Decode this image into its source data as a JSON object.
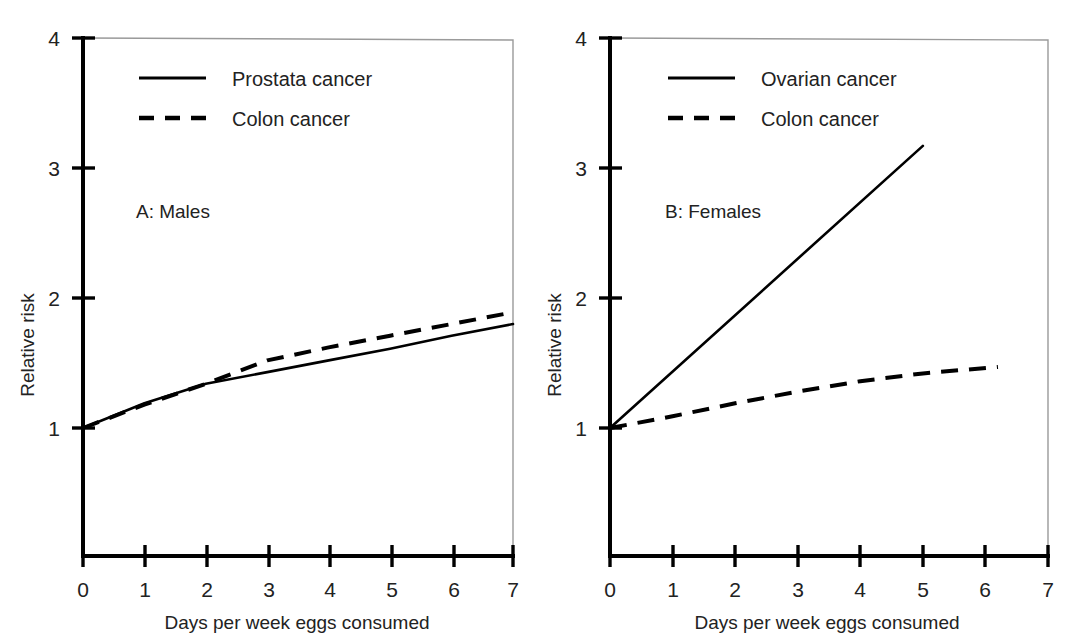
{
  "figure": {
    "panels": [
      {
        "id": "A",
        "label": "A: Males",
        "xlabel": "Days per week eggs consumed",
        "ylabel": "Relative risk",
        "xticks": [
          "0",
          "1",
          "2",
          "3",
          "4",
          "5",
          "6",
          "7"
        ],
        "yticks": [
          "1",
          "2",
          "3",
          "4"
        ],
        "legend": [
          {
            "name": "Prostata cancer",
            "style": "solid"
          },
          {
            "name": "Colon cancer",
            "style": "dashed"
          }
        ]
      },
      {
        "id": "B",
        "label": "B: Females",
        "xlabel": "Days per week eggs consumed",
        "ylabel": "Relative risk",
        "xticks": [
          "0",
          "1",
          "2",
          "3",
          "4",
          "5",
          "6",
          "7"
        ],
        "yticks": [
          "1",
          "2",
          "3",
          "4"
        ],
        "legend": [
          {
            "name": "Ovarian cancer",
            "style": "solid"
          },
          {
            "name": "Colon cancer",
            "style": "dashed"
          }
        ]
      }
    ]
  },
  "chart_data": [
    {
      "type": "line",
      "title": "A: Males",
      "xlabel": "Days per week eggs consumed",
      "ylabel": "Relative risk",
      "xlim": [
        0,
        7
      ],
      "ylim": [
        0,
        4
      ],
      "xticks": [
        0,
        1,
        2,
        3,
        4,
        5,
        6,
        7
      ],
      "yticks": [
        1,
        2,
        3,
        4
      ],
      "grid": false,
      "legend_position": "top-center",
      "series": [
        {
          "name": "Prostata cancer",
          "style": "solid",
          "x": [
            0,
            1,
            2,
            3,
            4,
            5,
            6,
            7
          ],
          "y": [
            1.0,
            1.19,
            1.34,
            1.43,
            1.52,
            1.61,
            1.71,
            1.8
          ]
        },
        {
          "name": "Colon cancer",
          "style": "dashed",
          "x": [
            0,
            1,
            2,
            3,
            4,
            5,
            6,
            7
          ],
          "y": [
            1.0,
            1.18,
            1.34,
            1.52,
            1.62,
            1.71,
            1.8,
            1.89
          ]
        }
      ]
    },
    {
      "type": "line",
      "title": "B: Females",
      "xlabel": "Days per week eggs consumed",
      "ylabel": "Relative risk",
      "xlim": [
        0,
        7
      ],
      "ylim": [
        0,
        4
      ],
      "xticks": [
        0,
        1,
        2,
        3,
        4,
        5,
        6,
        7
      ],
      "yticks": [
        1,
        2,
        3,
        4
      ],
      "grid": false,
      "legend_position": "top-center",
      "series": [
        {
          "name": "Ovarian cancer",
          "style": "solid",
          "x": [
            0,
            5
          ],
          "y": [
            1.0,
            3.17
          ]
        },
        {
          "name": "Colon cancer",
          "style": "dashed",
          "x": [
            0,
            1,
            2,
            3,
            4,
            5,
            6.2
          ],
          "y": [
            1.0,
            1.09,
            1.19,
            1.28,
            1.36,
            1.42,
            1.47
          ]
        }
      ]
    }
  ],
  "colors": {
    "line": "#000000",
    "text": "#222222",
    "box": "#9a9a9a",
    "background": "#ffffff"
  }
}
